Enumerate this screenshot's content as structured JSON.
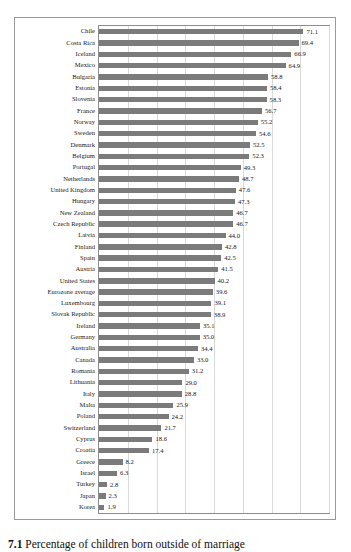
{
  "caption": {
    "number": "7.1",
    "text": "Percentage of children born outside of marriage"
  },
  "chart_data": {
    "type": "bar",
    "orientation": "horizontal",
    "title": "Percentage of children born outside of marriage",
    "xlabel": "",
    "ylabel": "",
    "xlim": [
      0,
      80
    ],
    "grid": true,
    "gridlines": [
      0,
      10,
      20,
      30,
      40,
      50,
      60,
      70,
      80
    ],
    "legend": "none",
    "bar_color": "#7b7b7b",
    "value_format": "one-decimal",
    "categories": [
      "Chile",
      "Costa Rica",
      "Iceland",
      "Mexico",
      "Bulgaria",
      "Estonia",
      "Slovenia",
      "France",
      "Norway",
      "Sweden",
      "Denmark",
      "Belgium",
      "Portugal",
      "Netherlands",
      "United Kingdom",
      "Hungary",
      "New Zealand",
      "Czech Republic",
      "Latvia",
      "Finland",
      "Spain",
      "Austria",
      "United States",
      "Eurozone average",
      "Luxembourg",
      "Slovak Republic",
      "Ireland",
      "Germany",
      "Australia",
      "Canada",
      "Romania",
      "Lithuania",
      "Italy",
      "Malta",
      "Poland",
      "Switzerland",
      "Cyprus",
      "Croatia",
      "Greece",
      "Israel",
      "Turkey",
      "Japan",
      "Korea"
    ],
    "values": [
      71.1,
      69.4,
      66.9,
      64.9,
      58.8,
      58.4,
      58.3,
      56.7,
      55.2,
      54.6,
      52.5,
      52.3,
      49.3,
      48.7,
      47.6,
      47.3,
      46.7,
      46.7,
      44.0,
      42.8,
      42.5,
      41.5,
      40.2,
      39.6,
      39.1,
      38.9,
      35.1,
      35.0,
      34.4,
      33.0,
      31.2,
      29.0,
      28.8,
      25.9,
      24.2,
      21.7,
      18.6,
      17.4,
      8.2,
      6.3,
      2.8,
      2.3,
      1.9
    ],
    "value_labels": [
      "71.1",
      "69.4",
      "66.9",
      "64.9",
      "58.8",
      "58.4",
      "58.3",
      "56.7",
      "55.2",
      "54.6",
      "52.5",
      "52.3",
      "49.3",
      "48.7",
      "47.6",
      "47.3",
      "46.7",
      "46.7",
      "44.0",
      "42.8",
      "42.5",
      "41.5",
      "40.2",
      "39.6",
      "39.1",
      "38.9",
      "35.1",
      "35.0",
      "34.4",
      "33.0",
      "31.2",
      "29.0",
      "28.8",
      "25.9",
      "24.2",
      "21.7",
      "18.6",
      "17.4",
      "8.2",
      "6.3",
      "2.8",
      "2.3",
      "1.9"
    ]
  }
}
